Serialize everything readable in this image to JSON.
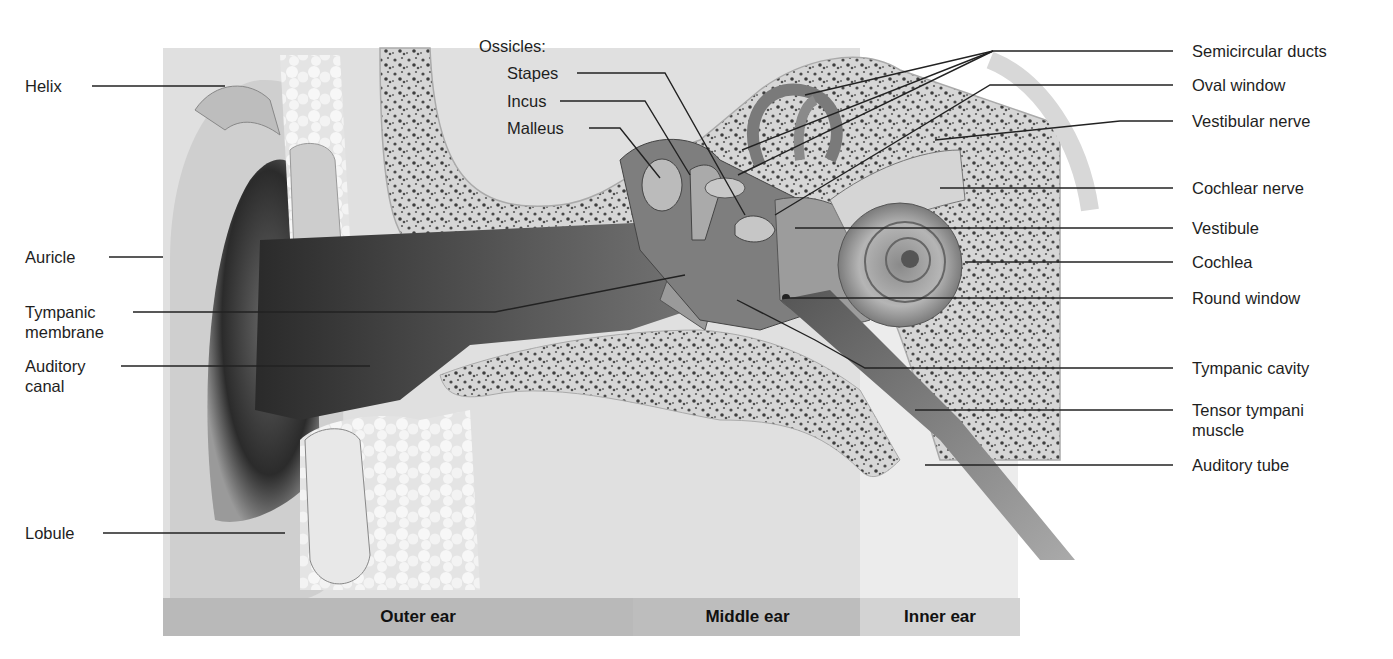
{
  "diagram": {
    "colors": {
      "background": "#ffffff",
      "skin_light": "#e6e6e6",
      "skin_dark": "#3a3a3a",
      "bone": "#d9d9d9",
      "bone_pores": "#555555",
      "region_bar_outer": "#b9b9b9",
      "region_bar_middle": "#bcbcbc",
      "region_bar_inner": "#d2d2d2",
      "leader_line": "#222222"
    },
    "left_labels": [
      {
        "id": "helix",
        "text": "Helix"
      },
      {
        "id": "auricle",
        "text": "Auricle"
      },
      {
        "id": "tympanic-membrane",
        "text": "Tympanic\nmembrane"
      },
      {
        "id": "auditory-canal",
        "text": "Auditory\ncanal"
      },
      {
        "id": "lobule",
        "text": "Lobule"
      }
    ],
    "ossicles": {
      "heading": "Ossicles:",
      "items": [
        {
          "id": "stapes",
          "text": "Stapes"
        },
        {
          "id": "incus",
          "text": "Incus"
        },
        {
          "id": "malleus",
          "text": "Malleus"
        }
      ]
    },
    "right_labels": [
      {
        "id": "semicircular-ducts",
        "text": "Semicircular ducts"
      },
      {
        "id": "oval-window",
        "text": "Oval window"
      },
      {
        "id": "vestibular-nerve",
        "text": "Vestibular nerve"
      },
      {
        "id": "cochlear-nerve",
        "text": "Cochlear nerve"
      },
      {
        "id": "vestibule",
        "text": "Vestibule"
      },
      {
        "id": "cochlea",
        "text": "Cochlea"
      },
      {
        "id": "round-window",
        "text": "Round window"
      },
      {
        "id": "tympanic-cavity",
        "text": "Tympanic cavity"
      },
      {
        "id": "tensor-tympani-muscle",
        "text": "Tensor tympani\nmuscle"
      },
      {
        "id": "auditory-tube",
        "text": "Auditory tube"
      }
    ],
    "regions": [
      {
        "id": "outer-ear",
        "text": "Outer ear"
      },
      {
        "id": "middle-ear",
        "text": "Middle ear"
      },
      {
        "id": "inner-ear",
        "text": "Inner ear"
      }
    ]
  }
}
